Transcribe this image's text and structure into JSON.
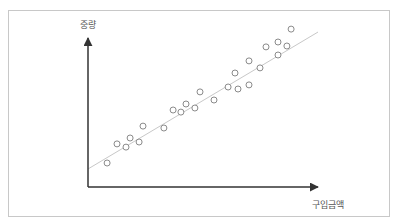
{
  "chart_data": {
    "type": "scatter",
    "title": "",
    "xlabel": "구입금액",
    "ylabel": "중량",
    "grid": false,
    "legend": null,
    "axis_ticks": false,
    "xlim": [
      0,
      100
    ],
    "ylim": [
      0,
      100
    ],
    "points": [
      {
        "x": 8.3,
        "y": 16.1
      },
      {
        "x": 12.6,
        "y": 28.9
      },
      {
        "x": 16.5,
        "y": 26.8
      },
      {
        "x": 18.3,
        "y": 32.9
      },
      {
        "x": 22.2,
        "y": 30.2
      },
      {
        "x": 23.9,
        "y": 40.9
      },
      {
        "x": 33.0,
        "y": 39.6
      },
      {
        "x": 37.0,
        "y": 51.7
      },
      {
        "x": 40.4,
        "y": 50.3
      },
      {
        "x": 42.6,
        "y": 55.7
      },
      {
        "x": 46.5,
        "y": 53.0
      },
      {
        "x": 48.7,
        "y": 63.8
      },
      {
        "x": 54.8,
        "y": 58.4
      },
      {
        "x": 60.9,
        "y": 67.1
      },
      {
        "x": 63.9,
        "y": 76.5
      },
      {
        "x": 65.2,
        "y": 65.8
      },
      {
        "x": 70.0,
        "y": 68.5
      },
      {
        "x": 70.0,
        "y": 84.6
      },
      {
        "x": 74.8,
        "y": 79.9
      },
      {
        "x": 77.4,
        "y": 94.0
      },
      {
        "x": 82.6,
        "y": 88.6
      },
      {
        "x": 82.6,
        "y": 97.3
      },
      {
        "x": 86.5,
        "y": 94.6
      },
      {
        "x": 88.3,
        "y": 106.0
      }
    ],
    "trend_line": {
      "x1": 0,
      "y1": 12.1,
      "x2": 100,
      "y2": 104.0
    },
    "colors": {
      "axis": "#333333",
      "point_stroke": "#8a8a8a",
      "trend_line": "#c8c8c8",
      "frame": "#c8c8c8",
      "label": "#555555"
    }
  }
}
